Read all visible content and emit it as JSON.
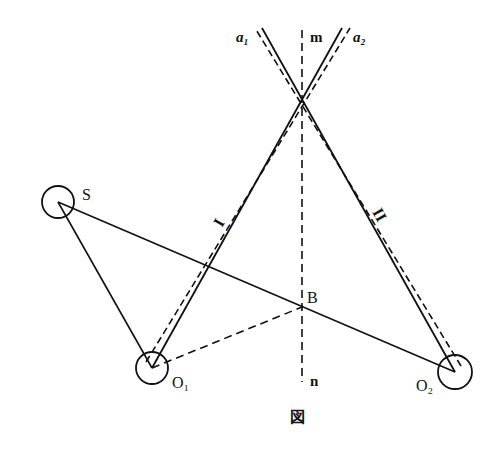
{
  "figure": {
    "caption": "図",
    "colors": {
      "ink": "#111111",
      "background": "#ffffff"
    },
    "points": {
      "S": {
        "label": "S",
        "x": 58,
        "y": 202,
        "r": 16
      },
      "O1": {
        "label": "O₁",
        "x": 152,
        "y": 368,
        "r": 16
      },
      "O2": {
        "label": "O₂",
        "x": 455,
        "y": 372,
        "r": 17
      },
      "B": {
        "label": "B",
        "x": 302,
        "y": 307
      },
      "X": {
        "x": 302,
        "y": 115
      }
    },
    "labels": {
      "a1": "a₁",
      "a2": "a₂",
      "m": "m",
      "n": "n",
      "ray1": "I",
      "ray2": "II",
      "S": "S",
      "B": "B",
      "O1": "O₁",
      "O2": "O₂"
    },
    "lines": [
      {
        "name": "mirror-I-solid",
        "style": "solid",
        "from": [
          152,
          368
        ],
        "to": [
          342,
          28
        ]
      },
      {
        "name": "mirror-I-dashed",
        "style": "dashed",
        "from": [
          146,
          362
        ],
        "to": [
          350,
          28
        ]
      },
      {
        "name": "mirror-II-solid",
        "style": "solid",
        "from": [
          455,
          372
        ],
        "to": [
          262,
          28
        ]
      },
      {
        "name": "mirror-II-dashed",
        "style": "dashed",
        "from": [
          461,
          366
        ],
        "to": [
          255,
          28
        ]
      },
      {
        "name": "axis-mn",
        "style": "dashed",
        "from": [
          302,
          30
        ],
        "to": [
          302,
          382
        ]
      },
      {
        "name": "S-to-O1",
        "style": "solid",
        "from": [
          58,
          202
        ],
        "to": [
          152,
          368
        ]
      },
      {
        "name": "S-to-O2",
        "style": "solid",
        "from": [
          58,
          202
        ],
        "to": [
          455,
          372
        ]
      },
      {
        "name": "O1-to-B",
        "style": "dashed",
        "from": [
          152,
          368
        ],
        "to": [
          302,
          307
        ]
      }
    ]
  }
}
